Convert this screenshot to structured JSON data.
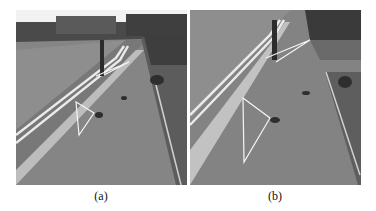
{
  "figure": {
    "panels": [
      {
        "id": "a",
        "caption": "(a)",
        "description": "Grayscale photo of a paved sidewalk beside a road with double white lines, a dark bollard, gravel bed at right, buildings and trees in the distance; white triangle overlays drawn on the pavement"
      },
      {
        "id": "b",
        "caption": "(b)",
        "description": "Closer grayscale photo of the same sidewalk with the bollard, double white road lines, gravel bed, and white triangle overlays"
      }
    ]
  }
}
